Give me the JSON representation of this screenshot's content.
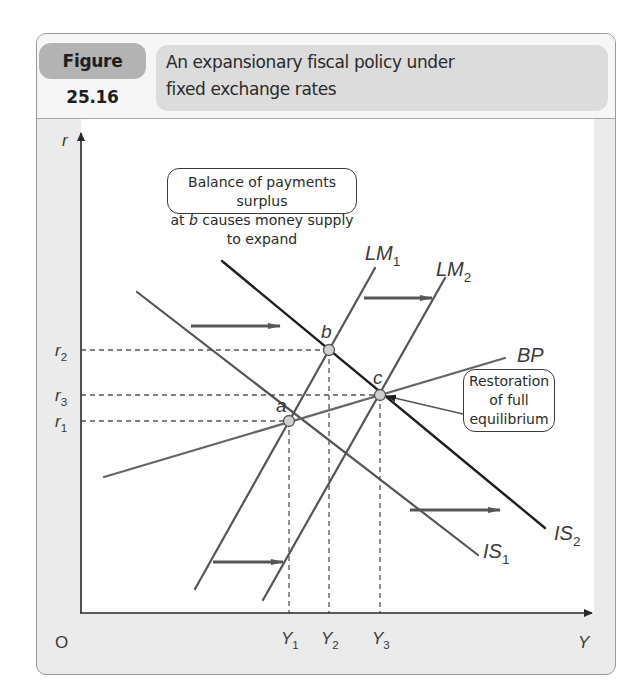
{
  "header": {
    "figure_label": "Figure 25.16",
    "title_line1": "An expansionary fiscal policy under",
    "title_line2": "fixed exchange rates"
  },
  "callouts": {
    "bop": {
      "line1": "Balance of payments surplus",
      "line2_pre": "at ",
      "line2_em": "b",
      "line2_post": " causes money supply to expand"
    },
    "restoration": {
      "line1": "Restoration",
      "line2": "of full",
      "line3": "equilibrium"
    }
  },
  "axes": {
    "origin": "O",
    "y_label": "r",
    "x_label": "Y"
  },
  "chart_data": {
    "type": "line",
    "title": "An expansionary fiscal policy under fixed exchange rates",
    "figure_number": "Figure 25.16",
    "xlabel": "Y",
    "ylabel": "r",
    "grid": false,
    "x_ticks": [
      {
        "label": "Y",
        "sub": "1",
        "px": 289
      },
      {
        "label": "Y",
        "sub": "2",
        "px": 329
      },
      {
        "label": "Y",
        "sub": "3",
        "px": 380
      }
    ],
    "y_ticks": [
      {
        "label": "r",
        "sub": "2",
        "py": 350
      },
      {
        "label": "r",
        "sub": "3",
        "py": 395
      },
      {
        "label": "r",
        "sub": "1",
        "py": 421
      }
    ],
    "series": [
      {
        "name": "IS1",
        "label": "IS",
        "sub": "1",
        "color": "#555555",
        "width": 2.2,
        "points": [
          [
            137,
            292
          ],
          [
            478,
            555
          ]
        ],
        "label_pos": [
          483,
          558
        ]
      },
      {
        "name": "IS2",
        "label": "IS",
        "sub": "2",
        "color": "#1e1e1e",
        "width": 2.4,
        "points": [
          [
            222,
            261
          ],
          [
            545,
            528
          ]
        ],
        "label_pos": [
          554,
          540
        ]
      },
      {
        "name": "LM1",
        "label": "LM",
        "sub": "1",
        "color": "#555555",
        "width": 2.2,
        "points": [
          [
            375,
            268
          ],
          [
            195,
            589
          ]
        ],
        "label_pos": [
          365,
          260
        ]
      },
      {
        "name": "LM2",
        "label": "LM",
        "sub": "2",
        "color": "#555555",
        "width": 2.2,
        "points": [
          [
            445,
            278
          ],
          [
            263,
            600
          ]
        ],
        "label_pos": [
          436,
          276
        ]
      },
      {
        "name": "BP",
        "label": "BP",
        "sub": "",
        "color": "#666666",
        "width": 2.2,
        "points": [
          [
            104,
            477
          ],
          [
            505,
            358
          ]
        ],
        "label_pos": [
          517,
          362
        ]
      }
    ],
    "equilibria": [
      {
        "name": "a",
        "x": 289,
        "y": 421,
        "label_pos": [
          276,
          412
        ]
      },
      {
        "name": "b",
        "x": 329,
        "y": 350,
        "label_pos": [
          321,
          338
        ]
      },
      {
        "name": "c",
        "x": 380,
        "y": 395,
        "label_pos": [
          373,
          384
        ]
      }
    ],
    "shift_arrows": [
      {
        "from": [
          191,
          326
        ],
        "to": [
          280,
          326
        ],
        "meaning": "IS shifts right"
      },
      {
        "from": [
          364,
          298
        ],
        "to": [
          432,
          298
        ],
        "meaning": "LM shifts right"
      },
      {
        "from": [
          213,
          562
        ],
        "to": [
          283,
          562
        ],
        "meaning": "LM shifts right"
      },
      {
        "from": [
          410,
          510
        ],
        "to": [
          500,
          510
        ],
        "meaning": "IS shifts right"
      }
    ],
    "annotations": [
      "Balance of payments surplus at b causes money supply to expand",
      "Restoration of full equilibrium"
    ]
  }
}
